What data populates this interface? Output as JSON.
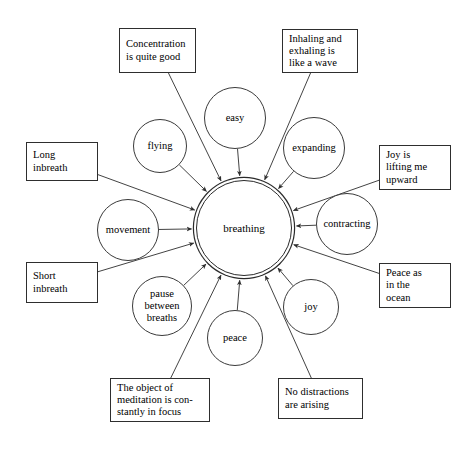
{
  "diagram": {
    "type": "radial-concept-map",
    "stroke_color": "#2e2e2e",
    "background_color": "#ffffff",
    "center": {
      "label": "breathing",
      "shape": "double-circle",
      "cx": 244,
      "cy": 228,
      "r": 48
    },
    "circles": [
      {
        "id": "easy",
        "label": "easy",
        "cx": 235,
        "cy": 118,
        "r": 31
      },
      {
        "id": "expanding",
        "label": "expanding",
        "cx": 314,
        "cy": 148,
        "r": 31
      },
      {
        "id": "contracting",
        "label": "contracting",
        "cx": 347,
        "cy": 224,
        "r": 31
      },
      {
        "id": "joy",
        "label": "joy",
        "cx": 311,
        "cy": 307,
        "r": 28
      },
      {
        "id": "peace",
        "label": "peace",
        "cx": 235,
        "cy": 338,
        "r": 28
      },
      {
        "id": "pause",
        "label": "pause\nbetween\nbreaths",
        "cx": 162,
        "cy": 306,
        "r": 30
      },
      {
        "id": "movement",
        "label": "movement",
        "cx": 128,
        "cy": 230,
        "r": 31
      },
      {
        "id": "flying",
        "label": "flying",
        "cx": 160,
        "cy": 146,
        "r": 27
      }
    ],
    "boxes": [
      {
        "id": "concentration",
        "label": "Concentration\nis quite good",
        "x": 119,
        "y": 28,
        "w": 77,
        "h": 45
      },
      {
        "id": "wave",
        "label": "Inhaling and\nexhaling is\nlike a wave",
        "x": 282,
        "y": 29,
        "w": 76,
        "h": 44
      },
      {
        "id": "joy-lifting",
        "label": "Joy is\nlifting me\nupward",
        "x": 379,
        "y": 145,
        "w": 72,
        "h": 45
      },
      {
        "id": "peace-ocean",
        "label": "Peace as\nin the\nocean",
        "x": 379,
        "y": 263,
        "w": 72,
        "h": 45
      },
      {
        "id": "no-distract",
        "label": "No distractions\nare arising",
        "x": 278,
        "y": 378,
        "w": 85,
        "h": 41
      },
      {
        "id": "object-focus",
        "label": "The object of\nmeditation is con-\nstantly in focus",
        "x": 110,
        "y": 378,
        "w": 100,
        "h": 44
      },
      {
        "id": "short-inbreath",
        "label": "Short\ninbreath",
        "x": 26,
        "y": 262,
        "w": 72,
        "h": 41
      },
      {
        "id": "long-inbreath",
        "label": "Long\ninbreath",
        "x": 26,
        "y": 142,
        "w": 72,
        "h": 39
      }
    ],
    "edges": [
      {
        "from": "easy",
        "to": "center"
      },
      {
        "from": "expanding",
        "to": "center"
      },
      {
        "from": "contracting",
        "to": "center"
      },
      {
        "from": "joy",
        "to": "center"
      },
      {
        "from": "peace",
        "to": "center"
      },
      {
        "from": "pause",
        "to": "center"
      },
      {
        "from": "movement",
        "to": "center"
      },
      {
        "from": "flying",
        "to": "center"
      },
      {
        "from": "concentration",
        "to": "center"
      },
      {
        "from": "wave",
        "to": "center"
      },
      {
        "from": "joy-lifting",
        "to": "center"
      },
      {
        "from": "peace-ocean",
        "to": "center"
      },
      {
        "from": "no-distract",
        "to": "center"
      },
      {
        "from": "object-focus",
        "to": "center"
      },
      {
        "from": "short-inbreath",
        "to": "center"
      },
      {
        "from": "long-inbreath",
        "to": "center"
      }
    ]
  }
}
